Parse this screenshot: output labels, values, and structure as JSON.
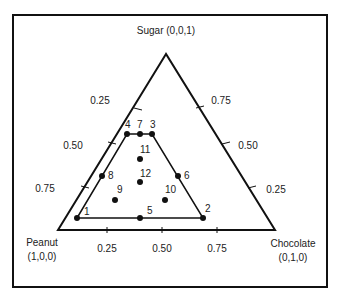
{
  "diagram": {
    "type": "ternary mixture design",
    "vertices": {
      "sugar": {
        "name": "Sugar",
        "coords": "(0,0,1)",
        "label": "Sugar (0,0,1)"
      },
      "peanut": {
        "name": "Peanut",
        "coords": "(1,0,0)"
      },
      "chocolate": {
        "name": "Chocolate",
        "coords": "(0,1,0)"
      }
    },
    "left_axis_ticks": [
      "0.25",
      "0.50",
      "0.75"
    ],
    "right_axis_ticks": [
      "0.75",
      "0.50",
      "0.25"
    ],
    "bottom_axis_ticks": [
      "0.25",
      "0.50",
      "0.75"
    ],
    "design_points": [
      {
        "id": "1",
        "x": 77,
        "y": 218,
        "lx": 84,
        "ly": 215
      },
      {
        "id": "2",
        "x": 203,
        "y": 218,
        "lx": 205,
        "ly": 212
      },
      {
        "id": "3",
        "x": 152,
        "y": 134,
        "lx": 150,
        "ly": 128
      },
      {
        "id": "4",
        "x": 127,
        "y": 134,
        "lx": 125,
        "ly": 128
      },
      {
        "id": "5",
        "x": 140,
        "y": 218,
        "lx": 147,
        "ly": 214
      },
      {
        "id": "6",
        "x": 178,
        "y": 176,
        "lx": 184,
        "ly": 179
      },
      {
        "id": "7",
        "x": 140,
        "y": 134,
        "lx": 137,
        "ly": 128
      },
      {
        "id": "8",
        "x": 102,
        "y": 176,
        "lx": 108,
        "ly": 179
      },
      {
        "id": "9",
        "x": 115,
        "y": 200,
        "lx": 117,
        "ly": 193
      },
      {
        "id": "10",
        "x": 165,
        "y": 200,
        "lx": 165,
        "ly": 193
      },
      {
        "id": "11",
        "x": 140,
        "y": 159,
        "lx": 140,
        "ly": 153
      },
      {
        "id": "12",
        "x": 140,
        "y": 182,
        "lx": 140,
        "ly": 177
      }
    ]
  }
}
